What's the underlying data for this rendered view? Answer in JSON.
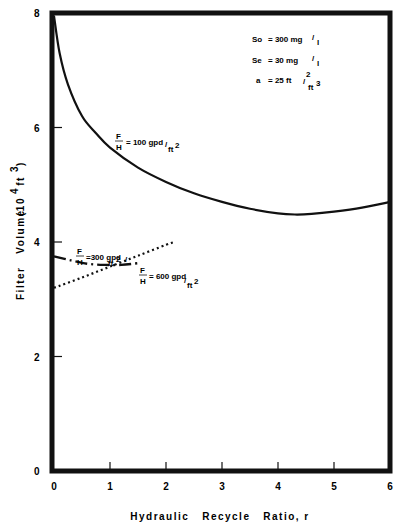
{
  "chart_data": {
    "type": "line",
    "title": "",
    "xlabel": "Hydraulic   Recycle   Ratio, r",
    "ylabel": "Filter   Volume   (10⁴ ft³)",
    "xlim": [
      0,
      6
    ],
    "ylim": [
      0,
      8
    ],
    "x_ticks": [
      0,
      1,
      2,
      3,
      4,
      5,
      6
    ],
    "y_ticks": [
      0,
      2,
      4,
      6,
      8
    ],
    "grid": false,
    "parameters": [
      {
        "label": "So",
        "value": "= 300 mg/l"
      },
      {
        "label": "Se",
        "value": "= 30  mg/l"
      },
      {
        "label": "a",
        "value": "= 25 ft²/ft³"
      }
    ],
    "series": [
      {
        "name": "F/H = 100 gpd/ft²",
        "style": "solid",
        "x": [
          0,
          0.1,
          0.25,
          0.5,
          0.75,
          1.0,
          1.5,
          2.0,
          2.5,
          3.0,
          3.5,
          4.0,
          4.3,
          4.6,
          5.0,
          5.5,
          6.0
        ],
        "y": [
          7.95,
          7.3,
          6.75,
          6.2,
          5.9,
          5.65,
          5.3,
          5.05,
          4.85,
          4.7,
          4.58,
          4.5,
          4.48,
          4.49,
          4.53,
          4.6,
          4.7
        ]
      },
      {
        "name": "F/H = 300 gpd/ft²",
        "style": "dash-dot",
        "x": [
          0,
          0.3,
          0.6,
          0.9,
          1.2,
          1.5
        ],
        "y": [
          3.75,
          3.68,
          3.62,
          3.6,
          3.6,
          3.63
        ]
      },
      {
        "name": "F/H = 600 gpd/ft²",
        "style": "dotted",
        "x": [
          0,
          0.5,
          1.0,
          1.5,
          2.0,
          2.15
        ],
        "y": [
          3.2,
          3.38,
          3.57,
          3.76,
          3.95,
          4.0
        ]
      }
    ]
  },
  "labels": {
    "y_tick_labels": [
      "0",
      "2",
      "4",
      "6",
      "8"
    ],
    "x_tick_labels": [
      "0",
      "1",
      "2",
      "3",
      "4",
      "5",
      "6"
    ],
    "xlabel": "Hydraulic   Recycle   Ratio, r",
    "ylabel_main": "Filter   Volume",
    "ylabel_unit_open": "(10",
    "ylabel_unit_exp": "4",
    "ylabel_unit_ft": " ft",
    "ylabel_unit_exp2": "3",
    "ylabel_unit_close": ")",
    "param_so_label": "So",
    "param_so_value": "= 300 mg",
    "param_se_label": "Se",
    "param_se_value": "= 30   mg",
    "param_mg_unit": "l",
    "param_a_label": "a",
    "param_a_value": "= 25  ft",
    "param_a_exp": "2",
    "param_a_den": "ft",
    "param_a_den_exp": "3",
    "fh_F": "F",
    "fh_H": "H",
    "curve100_value": "= 100 gpd",
    "curve300_value": "=300 gpd",
    "curve600_value": "= 600 gpd",
    "ft": "ft",
    "ft_exp": "2"
  }
}
